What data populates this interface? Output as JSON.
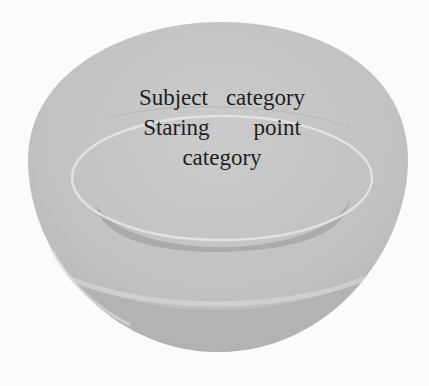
{
  "diagram": {
    "type": "nested-category-bowl",
    "outer": {
      "label": "Subject category",
      "words": [
        "Subject",
        "category"
      ]
    },
    "inner": {
      "label": "Staring point category",
      "line1_words": [
        "Staring",
        "point"
      ],
      "line2": "category"
    },
    "colors": {
      "background": "#fbfbfa",
      "bowl_fill": "#c4c4c4",
      "bowl_shadow": "#acacac",
      "rim_highlight": "#e6e6e6",
      "text": "#1e1e1e"
    }
  }
}
